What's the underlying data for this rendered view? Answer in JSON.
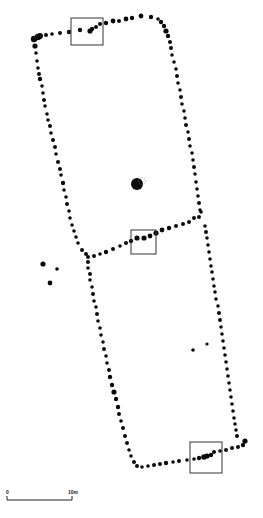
{
  "diagram": {
    "type": "archaeological-site-plan",
    "colors": {
      "posthole": "#0a0a0a",
      "box": "#333333",
      "background": "#ffffff",
      "scale": "#222222"
    },
    "scale_bar": {
      "x1": 7,
      "x2": 72,
      "y": 500,
      "tick_height": 4,
      "label_start": "0",
      "label_end": "10m"
    },
    "highlight_boxes": [
      {
        "id": "box-north-wall",
        "x": 71,
        "y": 18,
        "w": 32,
        "h": 27
      },
      {
        "id": "box-partition-wall",
        "x": 131,
        "y": 230,
        "w": 25,
        "h": 24
      },
      {
        "id": "box-south-wall",
        "x": 190,
        "y": 442,
        "w": 32,
        "h": 31
      }
    ],
    "central_feature": {
      "cx": 137,
      "cy": 184,
      "r": 6
    },
    "postholes": [
      [
        34,
        39,
        3.2
      ],
      [
        38,
        37,
        3.2
      ],
      [
        40,
        36,
        3
      ],
      [
        46,
        35,
        2
      ],
      [
        52,
        34,
        1.8
      ],
      [
        60,
        33,
        2
      ],
      [
        69,
        32,
        2.2
      ],
      [
        80,
        30,
        2.2
      ],
      [
        90,
        31,
        2.6
      ],
      [
        92,
        29,
        2.2
      ],
      [
        96,
        27,
        2
      ],
      [
        100,
        24,
        2
      ],
      [
        106,
        23,
        2.2
      ],
      [
        113,
        21,
        2.4
      ],
      [
        119,
        21,
        2
      ],
      [
        126,
        19,
        2.4
      ],
      [
        132,
        18,
        2.2
      ],
      [
        141,
        16,
        2.4
      ],
      [
        151,
        17,
        2.2
      ],
      [
        158,
        19,
        1.8
      ],
      [
        161,
        22,
        2.2
      ],
      [
        164,
        26,
        2.2
      ],
      [
        166,
        31,
        2.6
      ],
      [
        168,
        36,
        2.2
      ],
      [
        35,
        46,
        2.6
      ],
      [
        36,
        53,
        1.8
      ],
      [
        37,
        61,
        1.8
      ],
      [
        38,
        68,
        1.8
      ],
      [
        39,
        74,
        2
      ],
      [
        40,
        79,
        2.2
      ],
      [
        42,
        86,
        1.8
      ],
      [
        43,
        93,
        1.8
      ],
      [
        44,
        100,
        2
      ],
      [
        45,
        106,
        1.8
      ],
      [
        47,
        114,
        1.8
      ],
      [
        48,
        120,
        1.8
      ],
      [
        50,
        126,
        2
      ],
      [
        51,
        133,
        1.8
      ],
      [
        53,
        140,
        2
      ],
      [
        55,
        147,
        2
      ],
      [
        56,
        154,
        1.8
      ],
      [
        58,
        162,
        2
      ],
      [
        60,
        169,
        2
      ],
      [
        61,
        175,
        1.8
      ],
      [
        63,
        183,
        2.2
      ],
      [
        64,
        190,
        1.8
      ],
      [
        66,
        197,
        1.8
      ],
      [
        67,
        204,
        2
      ],
      [
        69,
        211,
        1.8
      ],
      [
        70,
        218,
        1.8
      ],
      [
        72,
        225,
        1.8
      ],
      [
        74,
        231,
        1.8
      ],
      [
        76,
        237,
        1.8
      ],
      [
        78,
        243,
        1.8
      ],
      [
        82,
        250,
        2
      ],
      [
        86,
        254,
        2
      ],
      [
        170,
        42,
        2
      ],
      [
        171,
        48,
        2
      ],
      [
        172,
        55,
        1.8
      ],
      [
        174,
        62,
        1.8
      ],
      [
        176,
        69,
        1.8
      ],
      [
        177,
        76,
        2
      ],
      [
        178,
        83,
        1.8
      ],
      [
        180,
        90,
        1.8
      ],
      [
        181,
        97,
        2
      ],
      [
        182,
        104,
        1.8
      ],
      [
        184,
        111,
        1.8
      ],
      [
        185,
        118,
        1.8
      ],
      [
        186,
        125,
        2
      ],
      [
        188,
        132,
        1.8
      ],
      [
        189,
        139,
        2
      ],
      [
        190,
        146,
        1.8
      ],
      [
        192,
        153,
        1.8
      ],
      [
        193,
        160,
        1.8
      ],
      [
        194,
        167,
        2
      ],
      [
        195,
        174,
        1.8
      ],
      [
        196,
        182,
        1.8
      ],
      [
        197,
        189,
        1.8
      ],
      [
        198,
        196,
        1.8
      ],
      [
        199,
        203,
        2
      ],
      [
        200,
        210,
        1.8
      ],
      [
        88,
        257,
        2
      ],
      [
        94,
        256,
        2
      ],
      [
        100,
        254,
        1.8
      ],
      [
        106,
        252,
        2.2
      ],
      [
        113,
        249,
        2
      ],
      [
        120,
        246,
        1.8
      ],
      [
        126,
        243,
        2
      ],
      [
        131,
        241,
        2.2
      ],
      [
        137,
        238,
        2.6
      ],
      [
        144,
        238,
        2.6
      ],
      [
        150,
        236,
        2.4
      ],
      [
        156,
        233,
        2.6
      ],
      [
        162,
        230,
        2.4
      ],
      [
        169,
        228,
        2.2
      ],
      [
        176,
        226,
        2
      ],
      [
        183,
        224,
        2
      ],
      [
        189,
        222,
        2
      ],
      [
        194,
        218,
        2
      ],
      [
        199,
        217,
        2
      ],
      [
        201,
        212,
        1.8
      ],
      [
        88,
        262,
        2
      ],
      [
        88,
        268,
        1.8
      ],
      [
        90,
        274,
        2
      ],
      [
        90,
        280,
        1.8
      ],
      [
        92,
        287,
        1.8
      ],
      [
        93,
        294,
        2
      ],
      [
        94,
        301,
        1.8
      ],
      [
        96,
        307,
        1.8
      ],
      [
        97,
        314,
        2
      ],
      [
        98,
        321,
        1.8
      ],
      [
        100,
        328,
        1.8
      ],
      [
        101,
        335,
        1.8
      ],
      [
        103,
        342,
        1.8
      ],
      [
        104,
        349,
        2
      ],
      [
        106,
        356,
        1.8
      ],
      [
        107,
        363,
        1.8
      ],
      [
        109,
        370,
        2
      ],
      [
        110,
        377,
        2.2
      ],
      [
        112,
        385,
        2.2
      ],
      [
        114,
        392,
        2.6
      ],
      [
        116,
        399,
        2.2
      ],
      [
        118,
        407,
        2.2
      ],
      [
        119,
        414,
        2
      ],
      [
        121,
        421,
        1.8
      ],
      [
        123,
        428,
        2
      ],
      [
        125,
        436,
        2
      ],
      [
        127,
        443,
        2
      ],
      [
        129,
        450,
        1.8
      ],
      [
        131,
        456,
        1.8
      ],
      [
        134,
        462,
        2
      ],
      [
        137,
        466,
        2
      ],
      [
        205,
        226,
        1.8
      ],
      [
        206,
        232,
        2
      ],
      [
        207,
        238,
        1.8
      ],
      [
        208,
        245,
        1.8
      ],
      [
        209,
        252,
        1.8
      ],
      [
        210,
        259,
        1.8
      ],
      [
        211,
        266,
        1.8
      ],
      [
        212,
        272,
        1.8
      ],
      [
        213,
        279,
        1.8
      ],
      [
        214,
        286,
        1.8
      ],
      [
        215,
        292,
        1.8
      ],
      [
        216,
        299,
        1.8
      ],
      [
        218,
        306,
        1.8
      ],
      [
        219,
        313,
        2
      ],
      [
        220,
        320,
        2
      ],
      [
        221,
        327,
        1.8
      ],
      [
        222,
        334,
        1.8
      ],
      [
        223,
        341,
        1.8
      ],
      [
        224,
        348,
        1.8
      ],
      [
        225,
        355,
        1.8
      ],
      [
        226,
        362,
        1.8
      ],
      [
        227,
        369,
        1.8
      ],
      [
        228,
        376,
        1.8
      ],
      [
        229,
        383,
        1.8
      ],
      [
        230,
        390,
        1.8
      ],
      [
        231,
        397,
        1.8
      ],
      [
        232,
        404,
        1.8
      ],
      [
        233,
        411,
        1.8
      ],
      [
        234,
        418,
        1.8
      ],
      [
        235,
        424,
        1.8
      ],
      [
        236,
        430,
        1.8
      ],
      [
        237,
        436,
        2
      ],
      [
        245,
        441,
        2.6
      ],
      [
        142,
        467,
        1.8
      ],
      [
        148,
        466,
        1.8
      ],
      [
        154,
        465,
        2
      ],
      [
        160,
        464,
        2
      ],
      [
        166,
        463,
        2.2
      ],
      [
        173,
        462,
        1.8
      ],
      [
        179,
        461,
        2
      ],
      [
        187,
        460,
        1.8
      ],
      [
        194,
        459,
        1.8
      ],
      [
        199,
        458,
        2.2
      ],
      [
        204,
        457,
        2.8
      ],
      [
        207,
        456,
        2.6
      ],
      [
        211,
        455,
        2.2
      ],
      [
        214,
        452,
        2
      ],
      [
        220,
        451,
        1.8
      ],
      [
        226,
        450,
        2
      ],
      [
        232,
        448,
        2
      ],
      [
        238,
        447,
        2
      ],
      [
        243,
        445,
        2.2
      ],
      [
        43,
        264,
        2.6
      ],
      [
        57,
        269,
        1.8
      ],
      [
        50,
        283,
        2.4
      ],
      [
        193,
        350,
        1.8
      ],
      [
        207,
        344,
        1.6
      ]
    ]
  }
}
